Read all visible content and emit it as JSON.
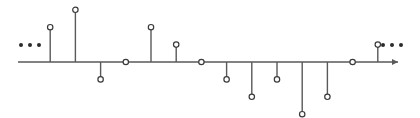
{
  "figure": {
    "axis_name": "n",
    "left_ellipsis": "•••",
    "right_ellipsis": "•••"
  },
  "chart_data": {
    "type": "stem",
    "title": "",
    "xlabel": "n",
    "ylabel": "",
    "grid": false,
    "legend": null,
    "xlim": [
      -5.6,
      10.6
    ],
    "ylim": [
      -3,
      3
    ],
    "x": [
      -4,
      -3,
      -2,
      -1,
      0,
      1,
      2,
      3,
      4,
      5,
      6,
      7,
      8,
      9
    ],
    "values": [
      2,
      3,
      -1,
      0,
      2,
      1,
      0,
      -1,
      -2,
      -1,
      -3,
      -2,
      0,
      1
    ],
    "x_tick_labels": [
      "-4",
      "-3",
      "-2",
      "-1",
      "0",
      "1",
      "2",
      "3",
      "4",
      "5",
      "6",
      "7",
      "8",
      "9"
    ],
    "value_labels": [
      "",
      "3",
      "-2",
      "",
      "2",
      "1",
      "",
      "-1",
      "-2",
      "",
      "-3",
      "",
      "",
      ""
    ],
    "continues_left": true,
    "continues_right": true
  },
  "colors": {
    "axis": "#595959",
    "stem": "#595959",
    "marker_edge": "#3a3a3a",
    "marker_fill": "#ffffff",
    "text": "#3a3a3a",
    "background": "#ffffff"
  }
}
